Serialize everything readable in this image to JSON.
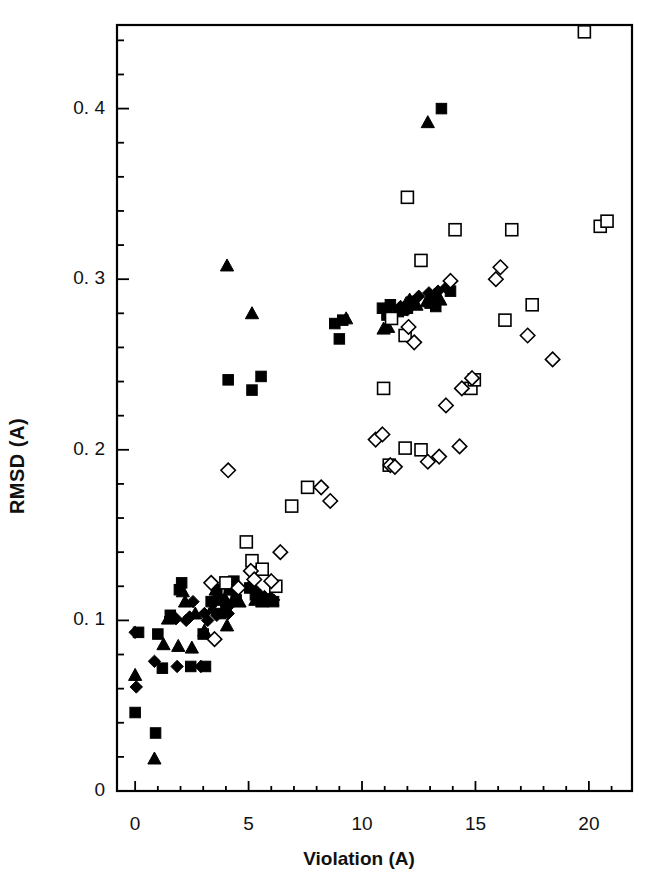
{
  "figure": {
    "background": "#ffffff",
    "foreground": "#000000"
  },
  "axes": {
    "x_label": "Violation (A)",
    "y_label": "RMSD (A)",
    "x_ticks": [
      "0",
      "5",
      "10",
      "15",
      "20"
    ],
    "y_ticks": [
      "0",
      "0. 1",
      "0. 2",
      "0. 3",
      "0. 4"
    ]
  },
  "chart_data": {
    "type": "scatter",
    "title": "",
    "xlabel": "Violation (A)",
    "ylabel": "RMSD (A)",
    "xlim": [
      -0.8,
      21.9
    ],
    "ylim": [
      0,
      0.449
    ],
    "x_ticks": [
      0,
      5,
      10,
      15,
      20
    ],
    "y_ticks": [
      0,
      0.1,
      0.2,
      0.3,
      0.4
    ],
    "x_minor_step": 1,
    "y_minor_step": 0.02,
    "grid": false,
    "legend": "none",
    "frame": "box",
    "series": [
      {
        "name": "filled-square",
        "marker": "filled-square",
        "color": "#000000",
        "points": [
          [
            0.0,
            0.046
          ],
          [
            0.9,
            0.034
          ],
          [
            0.15,
            0.093
          ],
          [
            1.0,
            0.092
          ],
          [
            1.55,
            0.103
          ],
          [
            1.2,
            0.072
          ],
          [
            1.95,
            0.118
          ],
          [
            2.05,
            0.122
          ],
          [
            2.45,
            0.073
          ],
          [
            3.0,
            0.092
          ],
          [
            3.1,
            0.073
          ],
          [
            3.35,
            0.111
          ],
          [
            3.6,
            0.118
          ],
          [
            3.75,
            0.104
          ],
          [
            4.0,
            0.108
          ],
          [
            4.15,
            0.119
          ],
          [
            4.35,
            0.123
          ],
          [
            4.45,
            0.112
          ],
          [
            5.05,
            0.119
          ],
          [
            5.3,
            0.115
          ],
          [
            5.5,
            0.113
          ],
          [
            5.85,
            0.112
          ],
          [
            6.1,
            0.111
          ],
          [
            4.1,
            0.241
          ],
          [
            5.15,
            0.235
          ],
          [
            5.55,
            0.243
          ],
          [
            8.8,
            0.274
          ],
          [
            9.15,
            0.276
          ],
          [
            9.0,
            0.265
          ],
          [
            10.9,
            0.283
          ],
          [
            11.1,
            0.279
          ],
          [
            11.25,
            0.285
          ],
          [
            11.6,
            0.281
          ],
          [
            12.0,
            0.283
          ],
          [
            12.25,
            0.287
          ],
          [
            13.0,
            0.286
          ],
          [
            13.25,
            0.284
          ],
          [
            13.9,
            0.293
          ],
          [
            13.5,
            0.4
          ]
        ]
      },
      {
        "name": "filled-triangle",
        "marker": "filled-triangle",
        "color": "#000000",
        "points": [
          [
            0.85,
            0.019
          ],
          [
            0.0,
            0.068
          ],
          [
            1.25,
            0.086
          ],
          [
            1.9,
            0.085
          ],
          [
            2.5,
            0.084
          ],
          [
            1.45,
            0.101
          ],
          [
            2.1,
            0.117
          ],
          [
            2.2,
            0.111
          ],
          [
            2.65,
            0.104
          ],
          [
            3.05,
            0.094
          ],
          [
            3.4,
            0.107
          ],
          [
            3.5,
            0.112
          ],
          [
            3.55,
            0.118
          ],
          [
            3.95,
            0.113
          ],
          [
            4.05,
            0.097
          ],
          [
            4.3,
            0.118
          ],
          [
            4.6,
            0.111
          ],
          [
            5.3,
            0.112
          ],
          [
            5.6,
            0.111
          ],
          [
            6.05,
            0.112
          ],
          [
            4.05,
            0.308
          ],
          [
            5.15,
            0.28
          ],
          [
            9.3,
            0.277
          ],
          [
            10.95,
            0.271
          ],
          [
            11.15,
            0.272
          ],
          [
            11.7,
            0.282
          ],
          [
            11.95,
            0.286
          ],
          [
            12.1,
            0.288
          ],
          [
            12.4,
            0.285
          ],
          [
            12.85,
            0.287
          ],
          [
            13.2,
            0.291
          ],
          [
            13.45,
            0.288
          ],
          [
            12.9,
            0.392
          ]
        ]
      },
      {
        "name": "filled-diamond",
        "marker": "filled-diamond",
        "color": "#000000",
        "points": [
          [
            0.05,
            0.061
          ],
          [
            0.85,
            0.076
          ],
          [
            0.0,
            0.093
          ],
          [
            1.85,
            0.073
          ],
          [
            1.55,
            0.102
          ],
          [
            1.8,
            0.101
          ],
          [
            2.25,
            0.1
          ],
          [
            2.4,
            0.102
          ],
          [
            2.9,
            0.073
          ],
          [
            2.55,
            0.111
          ],
          [
            3.05,
            0.104
          ],
          [
            3.2,
            0.1
          ],
          [
            3.6,
            0.103
          ],
          [
            3.75,
            0.113
          ],
          [
            4.1,
            0.104
          ],
          [
            4.25,
            0.11
          ],
          [
            4.55,
            0.12
          ],
          [
            5.05,
            0.12
          ],
          [
            5.35,
            0.117
          ],
          [
            5.5,
            0.114
          ],
          [
            5.7,
            0.114
          ],
          [
            5.95,
            0.113
          ],
          [
            6.1,
            0.112
          ],
          [
            11.7,
            0.284
          ],
          [
            12.0,
            0.282
          ],
          [
            12.5,
            0.29
          ],
          [
            12.95,
            0.292
          ],
          [
            13.35,
            0.293
          ],
          [
            13.7,
            0.295
          ]
        ]
      },
      {
        "name": "open-square",
        "marker": "open-square",
        "color": "#000000",
        "points": [
          [
            4.0,
            0.122
          ],
          [
            4.9,
            0.146
          ],
          [
            5.15,
            0.135
          ],
          [
            5.6,
            0.13
          ],
          [
            6.2,
            0.12
          ],
          [
            6.9,
            0.167
          ],
          [
            7.6,
            0.178
          ],
          [
            11.2,
            0.191
          ],
          [
            11.9,
            0.201
          ],
          [
            12.6,
            0.2
          ],
          [
            10.95,
            0.236
          ],
          [
            11.9,
            0.267
          ],
          [
            14.8,
            0.236
          ],
          [
            14.95,
            0.241
          ],
          [
            16.3,
            0.276
          ],
          [
            17.5,
            0.285
          ],
          [
            11.3,
            0.277
          ],
          [
            12.0,
            0.348
          ],
          [
            12.6,
            0.311
          ],
          [
            14.1,
            0.329
          ],
          [
            16.6,
            0.329
          ],
          [
            20.5,
            0.331
          ],
          [
            20.8,
            0.334
          ],
          [
            19.8,
            0.445
          ]
        ]
      },
      {
        "name": "open-diamond",
        "marker": "open-diamond",
        "color": "#000000",
        "points": [
          [
            3.5,
            0.089
          ],
          [
            3.35,
            0.122
          ],
          [
            4.55,
            0.119
          ],
          [
            5.1,
            0.129
          ],
          [
            5.25,
            0.124
          ],
          [
            6.0,
            0.123
          ],
          [
            6.4,
            0.14
          ],
          [
            4.1,
            0.188
          ],
          [
            8.6,
            0.17
          ],
          [
            8.2,
            0.178
          ],
          [
            10.6,
            0.206
          ],
          [
            10.9,
            0.209
          ],
          [
            11.25,
            0.191
          ],
          [
            11.45,
            0.19
          ],
          [
            12.9,
            0.193
          ],
          [
            13.4,
            0.196
          ],
          [
            14.3,
            0.202
          ],
          [
            13.7,
            0.226
          ],
          [
            14.4,
            0.236
          ],
          [
            14.85,
            0.242
          ],
          [
            15.9,
            0.3
          ],
          [
            16.1,
            0.307
          ],
          [
            17.3,
            0.267
          ],
          [
            18.4,
            0.253
          ],
          [
            12.05,
            0.272
          ],
          [
            12.3,
            0.263
          ],
          [
            13.9,
            0.299
          ]
        ]
      }
    ]
  }
}
